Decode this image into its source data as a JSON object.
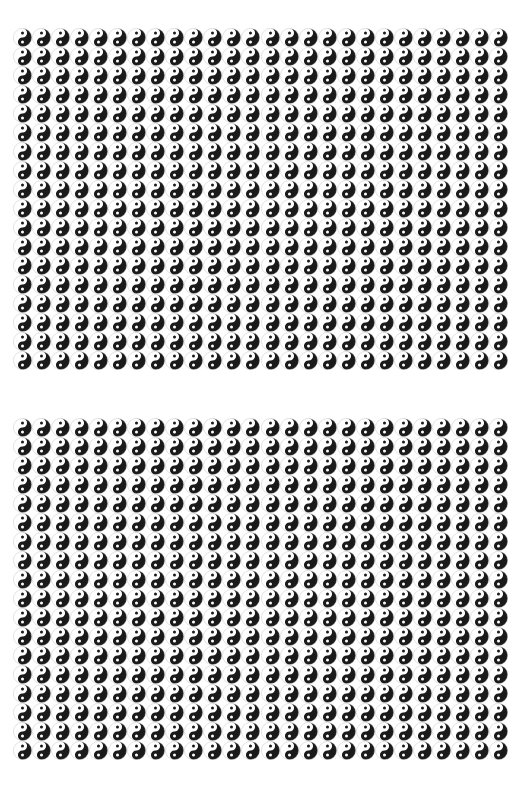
{
  "page": {
    "background_color": "#ffffff",
    "width": 521,
    "height": 795
  },
  "symbol": {
    "name": "yin-yang-symbol",
    "alt_name": "taijitu",
    "glyph": "☯",
    "dark_color": "#1a1a1a",
    "light_color": "#ffffff",
    "outline_color": "#b4b4b4",
    "diameter_px": 19,
    "orientation": "light-upper-left-dark-lower-right"
  },
  "layout": {
    "panel_rows": 2,
    "panel_columns": 2,
    "panels_total": 4,
    "symbol_columns_per_panel": 13,
    "symbol_rows_per_panel": 18,
    "symbols_per_panel": 234,
    "symbols_total": 936,
    "cell_width_px": 19,
    "cell_height_px": 19,
    "column_gap_px": 0,
    "row_gap_px": 0
  },
  "panels": [
    {
      "id": "panel-top-left",
      "label": "Top Left Panel",
      "position": "top-left",
      "columns": 13,
      "rows": 18,
      "count": 234
    },
    {
      "id": "panel-top-right",
      "label": "Top Right Panel",
      "position": "top-right",
      "columns": 13,
      "rows": 18,
      "count": 234
    },
    {
      "id": "panel-bottom-left",
      "label": "Bottom Left Panel",
      "position": "bottom-left",
      "columns": 13,
      "rows": 18,
      "count": 234
    },
    {
      "id": "panel-bottom-right",
      "label": "Bottom Right Panel",
      "position": "bottom-right",
      "columns": 13,
      "rows": 18,
      "count": 234
    }
  ]
}
